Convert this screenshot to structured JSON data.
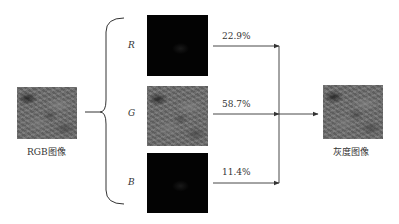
{
  "diagram": {
    "input": {
      "label": "RGB图像",
      "icon": "rgb-image"
    },
    "output": {
      "label": "灰度图像",
      "icon": "grayscale-image"
    },
    "channels": [
      {
        "name": "R",
        "weight": "22.9%",
        "image": "red-channel-image"
      },
      {
        "name": "G",
        "weight": "58.7%",
        "image": "green-channel-image"
      },
      {
        "name": "B",
        "weight": "11.4%",
        "image": "blue-channel-image"
      }
    ],
    "colors": {
      "line": "#333333",
      "channel_dark": "#030303",
      "gray_texture": "#6e6e6e"
    }
  }
}
